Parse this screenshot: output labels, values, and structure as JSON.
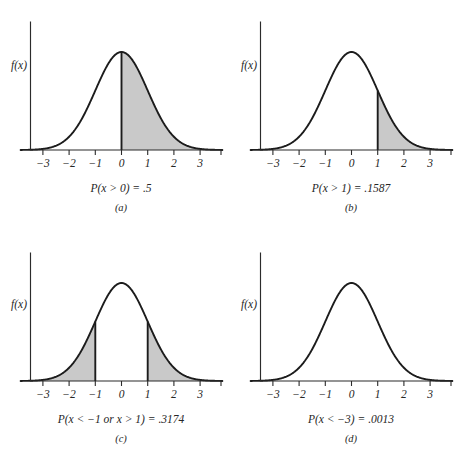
{
  "figure": {
    "background_color": "#ffffff",
    "curve_color": "#1c1c1c",
    "shade_color": "#c9c9c9",
    "axis_color": "#2b2b2b"
  },
  "chart_data": [
    {
      "type": "area",
      "panel_id": "a",
      "panel_label": "(a)",
      "caption": "P(x > 0) = .5",
      "ylabel": "f(x)",
      "xlabel": "",
      "xlim": [
        -3.85,
        3.85
      ],
      "ylim": [
        0,
        1.06
      ],
      "xticks": [
        -3,
        -2,
        -1,
        0,
        1,
        2,
        3
      ],
      "xticklabels": [
        "−3",
        "−2",
        "−1",
        "0",
        "1",
        "2",
        "3"
      ],
      "grid": false,
      "legend": "none",
      "distribution": "standard normal (mean 0, sd 1)",
      "shaded_intervals": [
        [
          0,
          3.85
        ]
      ],
      "divider_lines": [
        0
      ],
      "probability": 0.5,
      "probability_text": ".5"
    },
    {
      "type": "area",
      "panel_id": "b",
      "panel_label": "(b)",
      "caption": "P(x > 1) = .1587",
      "ylabel": "f(x)",
      "xlabel": "",
      "xlim": [
        -3.85,
        3.85
      ],
      "ylim": [
        0,
        1.06
      ],
      "xticks": [
        -3,
        -2,
        -1,
        0,
        1,
        2,
        3
      ],
      "xticklabels": [
        "−3",
        "−2",
        "−1",
        "0",
        "1",
        "2",
        "3"
      ],
      "grid": false,
      "legend": "none",
      "distribution": "standard normal (mean 0, sd 1)",
      "shaded_intervals": [
        [
          1,
          3.85
        ]
      ],
      "divider_lines": [
        1
      ],
      "probability": 0.1587,
      "probability_text": ".1587"
    },
    {
      "type": "area",
      "panel_id": "c",
      "panel_label": "(c)",
      "caption": "P(x < −1 or x > 1) = .3174",
      "ylabel": "f(x)",
      "xlabel": "",
      "xlim": [
        -3.85,
        3.85
      ],
      "ylim": [
        0,
        1.06
      ],
      "xticks": [
        -3,
        -2,
        -1,
        0,
        1,
        2,
        3
      ],
      "xticklabels": [
        "−3",
        "−2",
        "−1",
        "0",
        "1",
        "2",
        "3"
      ],
      "grid": false,
      "legend": "none",
      "distribution": "standard normal (mean 0, sd 1)",
      "shaded_intervals": [
        [
          -3.85,
          -1
        ],
        [
          1,
          3.85
        ]
      ],
      "divider_lines": [
        -1,
        1
      ],
      "probability": 0.3174,
      "probability_text": ".3174"
    },
    {
      "type": "area",
      "panel_id": "d",
      "panel_label": "(d)",
      "caption": "P(x < −3) = .0013",
      "ylabel": "f(x)",
      "xlabel": "",
      "xlim": [
        -3.85,
        3.85
      ],
      "ylim": [
        0,
        1.06
      ],
      "xticks": [
        -3,
        -2,
        -1,
        0,
        1,
        2,
        3
      ],
      "xticklabels": [
        "−3",
        "−2",
        "−1",
        "0",
        "1",
        "2",
        "3"
      ],
      "grid": false,
      "legend": "none",
      "distribution": "standard normal (mean 0, sd 1)",
      "shaded_intervals": [
        [
          -3.85,
          -3
        ]
      ],
      "divider_lines": [],
      "probability": 0.0013,
      "probability_text": ".0013"
    }
  ]
}
